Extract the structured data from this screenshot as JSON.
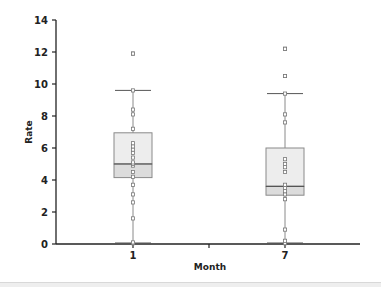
{
  "chart_data": {
    "type": "box",
    "title": "",
    "xlabel": "Month",
    "ylabel": "Rate",
    "ylim": [
      0,
      14
    ],
    "yticks": [
      0,
      2,
      4,
      6,
      8,
      10,
      12,
      14
    ],
    "categories": [
      "1",
      "7"
    ],
    "boxes": [
      {
        "category": "1",
        "whisker_low": 0.05,
        "q1": 4.15,
        "median": 5.0,
        "q3": 6.95,
        "whisker_high": 9.6,
        "outliers": [
          11.9
        ],
        "points": [
          0.05,
          0.1,
          1.6,
          2.6,
          3.1,
          3.7,
          4.2,
          4.5,
          4.9,
          5.0,
          5.1,
          5.4,
          5.7,
          5.9,
          6.1,
          6.3,
          7.2,
          8.1,
          8.4,
          9.6,
          11.9
        ]
      },
      {
        "category": "7",
        "whisker_low": 0.05,
        "q1": 3.05,
        "median": 3.6,
        "q3": 6.0,
        "whisker_high": 9.4,
        "outliers": [
          10.5,
          12.2
        ],
        "points": [
          0.05,
          0.2,
          0.9,
          2.8,
          3.1,
          3.3,
          3.5,
          3.7,
          4.5,
          4.8,
          5.0,
          5.3,
          7.6,
          8.1,
          9.4,
          10.5,
          12.2
        ]
      }
    ],
    "colors": {
      "box_fill": "#ededed",
      "box_lower_fill": "#dcdcdc",
      "box_stroke": "#8a8a8a",
      "axis": "#222222",
      "point": "#777777"
    },
    "grid": false,
    "legend": null
  }
}
